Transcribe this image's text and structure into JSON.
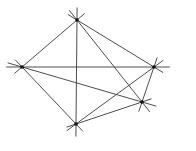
{
  "diagram": {
    "type": "graph",
    "colors": {
      "line": "#3a3a3a",
      "node": "#111111",
      "background": "#ffffff"
    },
    "extension": 0.12,
    "nodes": [
      {
        "id": "A",
        "x": 77,
        "y": 20
      },
      {
        "id": "B",
        "x": 22,
        "y": 67
      },
      {
        "id": "C",
        "x": 154,
        "y": 67
      },
      {
        "id": "D",
        "x": 142,
        "y": 102
      },
      {
        "id": "E",
        "x": 76,
        "y": 124
      }
    ],
    "edges": [
      [
        "A",
        "B"
      ],
      [
        "A",
        "C"
      ],
      [
        "A",
        "D"
      ],
      [
        "A",
        "E"
      ],
      [
        "B",
        "C"
      ],
      [
        "B",
        "D"
      ],
      [
        "B",
        "E"
      ],
      [
        "C",
        "D"
      ],
      [
        "C",
        "E"
      ],
      [
        "D",
        "E"
      ]
    ]
  }
}
